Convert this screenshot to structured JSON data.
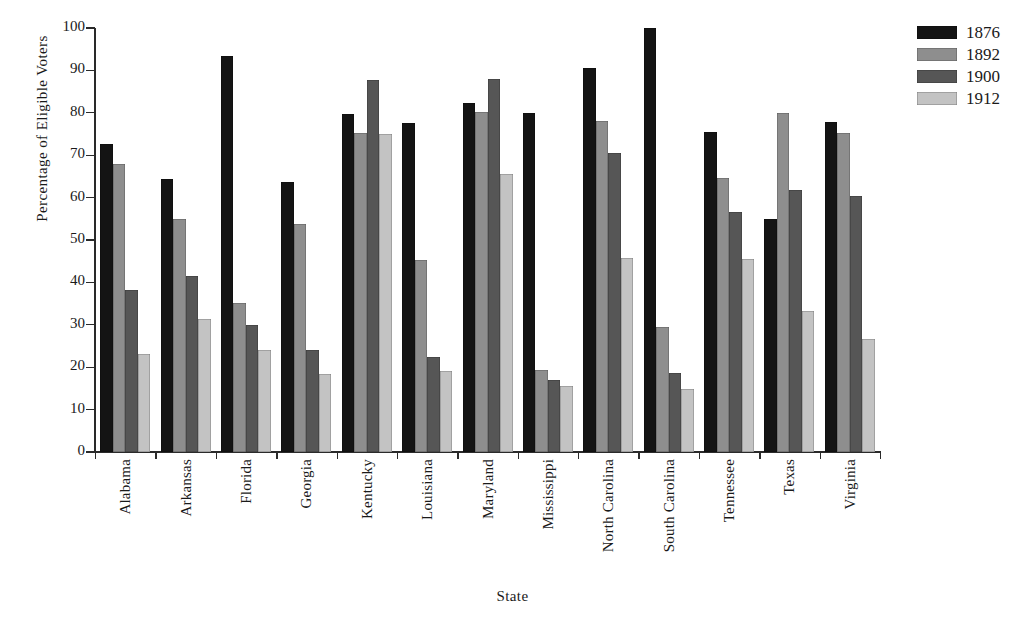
{
  "chart_data": {
    "type": "bar",
    "title": "",
    "xlabel": "State",
    "ylabel": "Percentage of Eligible Voters",
    "ylim": [
      0,
      100
    ],
    "yticks": [
      0,
      10,
      20,
      30,
      40,
      50,
      60,
      70,
      80,
      90,
      100
    ],
    "grid": false,
    "legend_position": "top-right",
    "categories": [
      "Alabama",
      "Arkansas",
      "Florida",
      "Georgia",
      "Kentucky",
      "Louisiana",
      "Maryland",
      "Mississippi",
      "North Carolina",
      "South Carolina",
      "Tennessee",
      "Texas",
      "Virginia"
    ],
    "series": [
      {
        "name": "1876",
        "color": "#141414",
        "values": [
          72.6,
          64.5,
          93.5,
          63.6,
          79.8,
          77.7,
          82.4,
          80.0,
          90.6,
          100.0,
          75.5,
          55.0,
          77.8
        ]
      },
      {
        "name": "1892",
        "color": "#8e8e8e",
        "values": [
          68.0,
          55.0,
          35.2,
          53.7,
          75.2,
          45.2,
          80.2,
          19.3,
          78.0,
          29.5,
          64.7,
          80.0,
          75.3
        ]
      },
      {
        "name": "1900",
        "color": "#565656",
        "values": [
          38.1,
          41.5,
          30.0,
          24.0,
          87.7,
          22.3,
          87.9,
          17.0,
          70.5,
          18.7,
          56.7,
          61.8,
          60.4
        ]
      },
      {
        "name": "1912",
        "color": "#c3c3c3",
        "values": [
          23.0,
          31.4,
          24.1,
          18.4,
          75.1,
          19.2,
          65.5,
          15.5,
          45.8,
          14.8,
          45.5,
          33.2,
          26.7
        ]
      }
    ]
  },
  "legend": {
    "entries": [
      {
        "label": "1876",
        "swatch": "legend-swatch-1876"
      },
      {
        "label": "1892",
        "swatch": "legend-swatch-1892"
      },
      {
        "label": "1900",
        "swatch": "legend-swatch-1900"
      },
      {
        "label": "1912",
        "swatch": "legend-swatch-1912"
      }
    ]
  }
}
